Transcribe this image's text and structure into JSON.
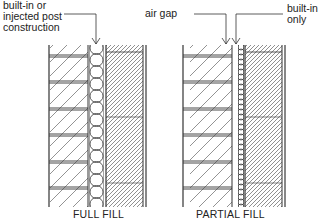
{
  "diagram": {
    "type": "cavity wall insulation sections",
    "panels": [
      {
        "id": "full-fill",
        "caption": "FULL FILL",
        "annotations": [
          {
            "text_lines": [
              "built-in or",
              "injected post",
              "construction"
            ],
            "points_to": "cavity insulation"
          }
        ],
        "layers": [
          "outer brick leaf",
          "full cavity insulation",
          "inner block leaf",
          "plaster finish"
        ]
      },
      {
        "id": "partial-fill",
        "caption": "PARTIAL FILL",
        "annotations": [
          {
            "text_lines": [
              "air gap"
            ],
            "points_to": "air gap"
          },
          {
            "text_lines": [
              "built-in",
              "only"
            ],
            "points_to": "partial cavity insulation"
          }
        ],
        "layers": [
          "outer brick leaf",
          "air gap",
          "partial cavity insulation",
          "inner block leaf",
          "plaster finish"
        ]
      }
    ]
  },
  "labels": {
    "full_note_1": "built-in or",
    "full_note_2": "injected post",
    "full_note_3": "construction",
    "air_gap": "air gap",
    "builtin_1": "built-in",
    "builtin_2": "only",
    "full_caption": "FULL FILL",
    "partial_caption": "PARTIAL FILL"
  },
  "colors": {
    "line": "#333333",
    "background": "#ffffff"
  }
}
